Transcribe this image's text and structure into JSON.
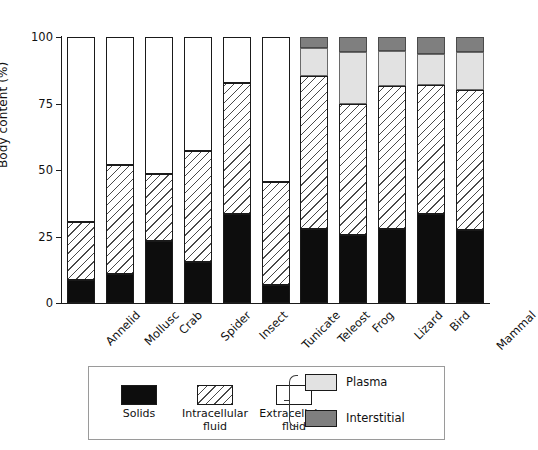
{
  "chart_data": {
    "type": "bar",
    "subtype": "stacked-bar",
    "title": "",
    "xlabel": "",
    "ylabel": "Body content (%)",
    "ylim": [
      0,
      100
    ],
    "yticks": [
      0,
      25,
      50,
      75,
      100
    ],
    "ytick_labels": [
      "0",
      "25",
      "50",
      "75",
      "100"
    ],
    "grid": false,
    "legend_position": "below-plot",
    "categories": [
      "Annelid",
      "Mollusc",
      "Crab",
      "Spider",
      "Insect",
      "Tunicate",
      "Teleost",
      "Frog",
      "Lizard",
      "Bird",
      "Mammal"
    ],
    "series": [
      {
        "name": "Solids",
        "fill": "solid-black",
        "color": "#0d0d0d",
        "values": [
          8.6,
          11.0,
          23.3,
          15.5,
          33.5,
          6.8,
          28.0,
          25.6,
          28.0,
          33.5,
          27.4
        ]
      },
      {
        "name": "Intracellular fluid",
        "fill": "hatched",
        "color": "#ffffff",
        "values": [
          21.9,
          41.0,
          25.2,
          41.5,
          49.2,
          38.7,
          57.5,
          49.2,
          53.6,
          48.5,
          52.6
        ]
      },
      {
        "name": "Extracellular fluid",
        "fill": "open-white",
        "color": "#ffffff",
        "values": [
          69.5,
          48.0,
          51.5,
          43.0,
          17.3,
          54.5,
          0,
          0,
          0,
          0,
          0
        ]
      },
      {
        "name": "Plasma",
        "fill": "light-grey",
        "color": "#e2e2e2",
        "values": [
          0,
          0,
          0,
          0,
          0,
          0,
          10.5,
          19.6,
          13.2,
          11.7,
          14.3
        ]
      },
      {
        "name": "Interstitial",
        "fill": "dark-grey",
        "color": "#7f7f7f",
        "values": [
          0,
          0,
          0,
          0,
          0,
          0,
          4.0,
          5.6,
          5.2,
          6.2,
          5.7
        ]
      }
    ],
    "cumulative_tops_percent": {
      "note": "running stack tops read off the y-axis, bottom to top",
      "Annelid": {
        "solids": 8.6,
        "intracellular": 30.5,
        "extracellular": 100
      },
      "Mollusc": {
        "solids": 11.0,
        "intracellular": 52.0,
        "extracellular": 100
      },
      "Crab": {
        "solids": 23.3,
        "intracellular": 48.5,
        "extracellular": 100
      },
      "Spider": {
        "solids": 15.5,
        "intracellular": 57.0,
        "extracellular": 100
      },
      "Insect": {
        "solids": 33.5,
        "intracellular": 82.7,
        "extracellular": 100
      },
      "Tunicate": {
        "solids": 6.8,
        "intracellular": 45.5,
        "extracellular": 100
      },
      "Teleost": {
        "solids": 28.0,
        "intracellular": 85.5,
        "plasma": 96.0,
        "interstitial": 100
      },
      "Frog": {
        "solids": 25.6,
        "intracellular": 74.8,
        "plasma": 94.4,
        "interstitial": 100
      },
      "Lizard": {
        "solids": 28.0,
        "intracellular": 81.6,
        "plasma": 94.8,
        "interstitial": 100
      },
      "Bird": {
        "solids": 33.5,
        "intracellular": 82.0,
        "plasma": 93.8,
        "interstitial": 100
      },
      "Mammal": {
        "solids": 27.4,
        "intracellular": 80.0,
        "plasma": 94.3,
        "interstitial": 100
      }
    }
  },
  "axis": {
    "y_title": "Body content (%)",
    "y_tick_labels": [
      "100",
      "75",
      "50",
      "25",
      "0"
    ]
  },
  "legend": {
    "items": [
      {
        "key": "solids",
        "label": "Solids",
        "swatch": "solid-black"
      },
      {
        "key": "intracellular",
        "label": "Intracellular\nfluid",
        "swatch": "hatched"
      },
      {
        "key": "extracellular",
        "label": "Extracellular\nfluid",
        "swatch": "open-white"
      }
    ],
    "grouped": [
      {
        "key": "plasma",
        "label": "Plasma",
        "swatch": "light-grey"
      },
      {
        "key": "interstitial",
        "label": "Interstitial",
        "swatch": "dark-grey"
      }
    ]
  },
  "colors": {
    "solids": "#0d0d0d",
    "intracellular": "#ffffff",
    "extracellular": "#ffffff",
    "plasma": "#e2e2e2",
    "interstitial": "#7f7f7f",
    "axis": "#1a1a1a",
    "background": "#ffffff"
  }
}
